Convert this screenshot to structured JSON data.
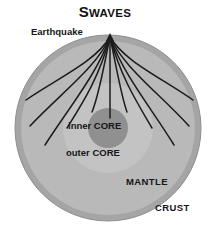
{
  "title": {
    "lead": "S",
    "rest": "WAVES",
    "full": "S WAVES"
  },
  "labels": {
    "earthquake": "Earthquake",
    "inner_core": "inner CORE",
    "outer_core": "outer CORE",
    "mantle": "MANTLE",
    "crust": "CRUST"
  },
  "colors": {
    "background": "#ffffff",
    "crust": "#a5a5a5",
    "crust_edge": "#8f8f8f",
    "mantle": "#b9b9b9",
    "outer_core": "#c3c3c3",
    "inner_core": "#909090",
    "ray": "#1c1c1c",
    "text": "#161616"
  },
  "geometry": {
    "center_x": 108,
    "center_y": 128,
    "earth_radius": 93,
    "crust_thickness": 6,
    "mantle_radius": 87,
    "outer_core_radius": 45,
    "inner_core_radius": 20,
    "source_x": 110,
    "source_y": 37
  },
  "rays": {
    "description": "S-wave ray paths from the earthquake focus, absorbed at the liquid outer core boundary",
    "count": 11,
    "paths": [
      "M110,37 C 95,62 58,78 26,100",
      "M110,37 C 96,68 62,92 30,126",
      "M110,37 C 97,74 70,106 45,145",
      "M110,37 C 99,78 82,104 67,128",
      "M110,37 C 103,70 99,95 92,112",
      "M110,37 L 110,118",
      "M110,37 C 117,70 121,95 127,112",
      "M110,37 C 121,78 138,104 152,128",
      "M110,37 C 123,74 150,106 174,145",
      "M110,37 C 124,68 158,92 189,126",
      "M110,37 C 125,62 162,78 193,100"
    ]
  }
}
